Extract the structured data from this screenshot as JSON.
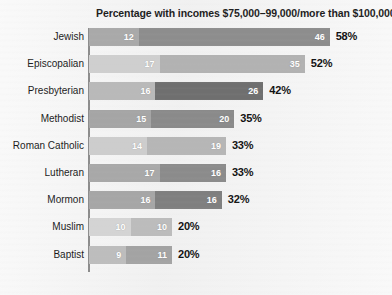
{
  "chart_data": {
    "type": "bar",
    "subtype": "stacked-horizontal",
    "title": "Percentage with incomes $75,000–99,000/more than $100,000",
    "xlabel": "",
    "ylabel": "",
    "grid": false,
    "legend_position": "none",
    "axis_origin_x_px": 88,
    "px_per_unit": 4.15,
    "categories": [
      "Jewish",
      "Episcopalian",
      "Presbyterian",
      "Methodist",
      "Roman Catholic",
      "Lutheran",
      "Mormon",
      "Muslim",
      "Baptist"
    ],
    "series": [
      {
        "name": "$75,000–99,000",
        "values": [
          12,
          17,
          16,
          15,
          14,
          17,
          16,
          10,
          9
        ]
      },
      {
        "name": "more than $100,000",
        "values": [
          46,
          35,
          26,
          20,
          19,
          16,
          16,
          10,
          11
        ]
      }
    ],
    "totals": [
      58,
      52,
      42,
      35,
      33,
      33,
      32,
      20,
      20
    ],
    "total_labels": [
      "58%",
      "52%",
      "42%",
      "35%",
      "33%",
      "33%",
      "32%",
      "20%",
      "20%"
    ],
    "xlim": [
      0,
      58
    ]
  },
  "rows": [
    {
      "label": "Jewish",
      "seg1_value": "12",
      "seg1_units": 12,
      "seg1_color": "#a9a9a9",
      "seg2_value": "46",
      "seg2_units": 46,
      "seg2_color": "#8d8d8d",
      "total": "58%"
    },
    {
      "label": "Episcopalian",
      "seg1_value": "17",
      "seg1_units": 17,
      "seg1_color": "#cfcfcf",
      "seg2_value": "35",
      "seg2_units": 35,
      "seg2_color": "#b2b2b2",
      "total": "52%"
    },
    {
      "label": "Presbyterian",
      "seg1_value": "16",
      "seg1_units": 16,
      "seg1_color": "#b9b9b9",
      "seg2_value": "26",
      "seg2_units": 26,
      "seg2_color": "#6f6f6f",
      "total": "42%"
    },
    {
      "label": "Methodist",
      "seg1_value": "15",
      "seg1_units": 15,
      "seg1_color": "#a5a5a5",
      "seg2_value": "20",
      "seg2_units": 20,
      "seg2_color": "#8a8a8a",
      "total": "35%"
    },
    {
      "label": "Roman Catholic",
      "seg1_value": "14",
      "seg1_units": 14,
      "seg1_color": "#cdcdcd",
      "seg2_value": "19",
      "seg2_units": 19,
      "seg2_color": "#b6b6b6",
      "total": "33%"
    },
    {
      "label": "Lutheran",
      "seg1_value": "17",
      "seg1_units": 17,
      "seg1_color": "#a8a8a8",
      "seg2_value": "16",
      "seg2_units": 16,
      "seg2_color": "#8b8b8b",
      "total": "33%"
    },
    {
      "label": "Mormon",
      "seg1_value": "16",
      "seg1_units": 16,
      "seg1_color": "#a6a6a6",
      "seg2_value": "16",
      "seg2_units": 16,
      "seg2_color": "#7f7f7f",
      "total": "32%"
    },
    {
      "label": "Muslim",
      "seg1_value": "10",
      "seg1_units": 10,
      "seg1_color": "#d4d4d4",
      "seg2_value": "10",
      "seg2_units": 10,
      "seg2_color": "#bcbcbc",
      "total": "20%"
    },
    {
      "label": "Baptist",
      "seg1_value": "9",
      "seg1_units": 9,
      "seg1_color": "#bdbdbd",
      "seg2_value": "11",
      "seg2_units": 11,
      "seg2_color": "#a3a3a3",
      "total": "20%"
    }
  ]
}
